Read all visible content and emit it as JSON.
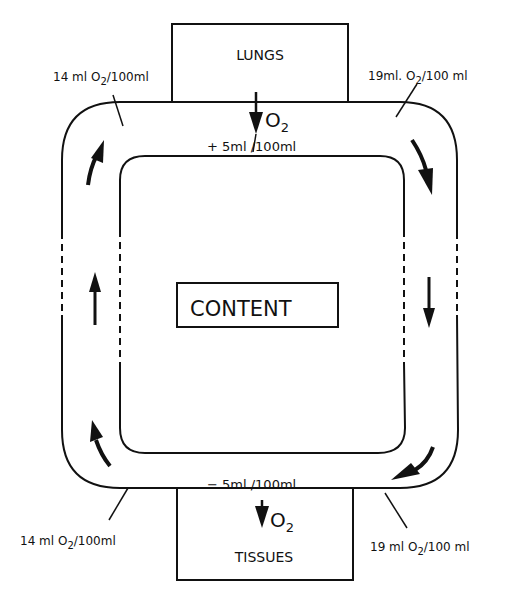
{
  "diagram": {
    "boxes": {
      "lungs": "LUNGS",
      "tissues": "TISSUES",
      "content": "CONTENT"
    },
    "exchange": {
      "lungs_gas": "O",
      "lungs_gas_sub": "2",
      "lungs_change": "+ 5ml /100ml",
      "tissues_gas": "O",
      "tissues_gas_sub": "2",
      "tissues_change": "− 5ml /100ml"
    },
    "annotations": {
      "top_left": {
        "prefix": "14 ml O",
        "sub": "2",
        "suffix": "/100ml"
      },
      "top_right": {
        "prefix": "19ml. O",
        "sub": "2",
        "suffix": "/100 ml"
      },
      "bottom_left": {
        "prefix": "14 ml  O",
        "sub": "2",
        "suffix": "/100ml"
      },
      "bottom_right": {
        "prefix": "19 ml  O",
        "sub": "2",
        "suffix": "/100 ml"
      }
    },
    "flow_direction": "clockwise"
  }
}
